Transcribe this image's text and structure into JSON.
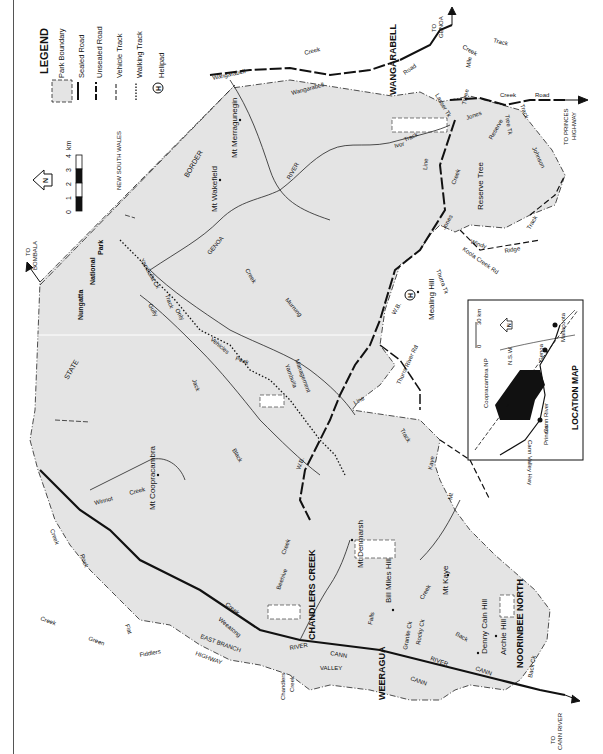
{
  "map": {
    "orientation": "rotated 90 degrees counter-clockwise",
    "colors": {
      "park_fill": "#e4e4e4",
      "road": "#111111",
      "background": "#ffffff",
      "inset_park": "#111111"
    },
    "legend": {
      "title": "LEGEND",
      "items": [
        {
          "symbol": "park-boundary",
          "label": "Park Boundary"
        },
        {
          "symbol": "sealed-road",
          "label": "Sealed Road"
        },
        {
          "symbol": "unsealed-road",
          "label": "Unsealed Road"
        },
        {
          "symbol": "vehicle-track",
          "label": "Vehicle Track"
        },
        {
          "symbol": "walking-track",
          "label": "Walking Track"
        },
        {
          "symbol": "helipad",
          "label": "Helipad",
          "glyph": "H"
        }
      ]
    },
    "north_arrow": {
      "label": "N"
    },
    "scale_bar": {
      "ticks": [
        "0",
        "1",
        "2",
        "3",
        "4"
      ],
      "unit": "km"
    },
    "regions": {
      "nsw": "NEW SOUTH WALES",
      "border_1": "BORDER",
      "border_2": "STATE",
      "np_1": "Nungatta",
      "np_2": "National",
      "np_3": "Park"
    },
    "towns": {
      "wangarabell": "WANGARABELL",
      "chandlers_creek": "CHANDLERS CREEK",
      "weeragua": "WEERAGUA",
      "noorinbee_north": "NOORINBEE NORTH"
    },
    "peaks": {
      "merragunegin": "Mt Merragunegin",
      "wakefield": "Mt Wakefield",
      "coopracambra": "Mt Coopracambra",
      "denmarsh": "Mt Denmarsh",
      "bill_miles": "Bill Miles Hill",
      "kaye": "Mt Kaye",
      "denny_cain": "Denny Cain Hill",
      "archie": "Archie Hill",
      "mealing": "Mealing Hill",
      "reserve_tree": "Reserve Tree"
    },
    "destinations": {
      "genoa_1": "TO",
      "genoa_2": "GENOA",
      "princes_1": "TO PRINCES",
      "princes_2": "HIGHWAY",
      "bombala_1": "TO",
      "bombala_2": "BOMBALA",
      "cann_1": "TO",
      "cann_2": "CANN RIVER"
    },
    "features": {
      "wangarabell_rd_1": "Wangarabell",
      "wangarabell_rd_2": "Wangarabell",
      "creek_top": "Creek",
      "road_1": "Road",
      "mile_1": "Mile",
      "creek_2": "Creek",
      "track_1": "Track",
      "three": "Three",
      "lasser_tk": "Lasser Tk",
      "jones_1": "Jones",
      "creek_3": "Creek",
      "road_2": "Road",
      "tree_tk": "Tree Tk",
      "track_2": "Track",
      "reserve": "Reserve",
      "johnson": "Johnson",
      "ivor": "Ivor",
      "track_3": "Track",
      "line_1": "Line",
      "creek_4": "Creek",
      "jones_2": "Jones",
      "river_1": "RIVER",
      "genoa_river": "GENOA",
      "windy": "Windy",
      "ridge": "Ridge",
      "track_4": "Track",
      "koola": "Koola Creek Rd",
      "thurra_tk": "Thurra Tk",
      "wb_1": "W.B.",
      "thurra_river_rd": "Thurra River Rd",
      "line_2": "Line",
      "track_5": "Track",
      "kaye": "Kaye",
      "mt": "Mt",
      "yambulla_ck": "Yambulla Ck",
      "creek_5": "Creek",
      "murrung": "Murrung",
      "gully": "Gully",
      "track_6": "Track",
      "only": "Only",
      "vehicles": "Vehicles",
      "peak": "Peak",
      "yambulla": "Yambulla",
      "management": "Management",
      "jack": "Jack",
      "black": "Black",
      "wb_2": "W.B.",
      "winnot": "Winnot",
      "creek_6": "Creek",
      "rock": "Rock",
      "creek_7": "Creek",
      "flat": "Flat",
      "creek_8": "Creek",
      "green": "Green",
      "fiddlers": "Fiddlers",
      "east_branch": "EAST BRANCH",
      "highway": "HIGHWAY",
      "weeatong": "Weeatong",
      "creek_9": "Creek",
      "beehive": "Beehive",
      "creek_10": "Creek",
      "river_2": "RIVER",
      "cann_1": "CANN",
      "valley": "VALLEY",
      "chandlers": "Chandlers",
      "creek_11": "Creek",
      "falls": "Falls",
      "granite_ck": "Granite Ck",
      "rocky_ck": "Rocky Ck",
      "creek_12": "Creek",
      "back_1": "Back",
      "river_3": "RIVER",
      "cann_2": "CANN",
      "cann_3": "CANN",
      "back_ck": "Back Ck"
    },
    "location_map": {
      "title": "LOCATION MAP",
      "scale_0": "0",
      "scale_30": "30 km",
      "np": "Coopracambra NP",
      "nsw": "N.S.W.",
      "genoa": "Genoa",
      "mallacoota": "Mallacoota",
      "cann_river": "Cann River",
      "hwy": "Hwy",
      "cann_valley_hwy": "Cann Valley Hwy",
      "princes": "Princes",
      "north": "N"
    },
    "helipad": {
      "glyph": "H"
    }
  }
}
